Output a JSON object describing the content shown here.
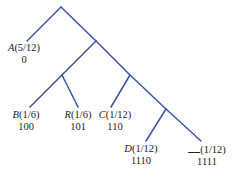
{
  "diagram": {
    "type": "huffman-code-tree",
    "line_color": "#3a55a8",
    "leaves": [
      {
        "symbol": "A",
        "prob": "(5/12)",
        "code": "0"
      },
      {
        "symbol": "B",
        "prob": "(1/6)",
        "code": "100"
      },
      {
        "symbol": "R",
        "prob": "(1/6)",
        "code": "101"
      },
      {
        "symbol": "C",
        "prob": "(1/12)",
        "code": "110"
      },
      {
        "symbol": "D",
        "prob": "(1/12)",
        "code": "1110"
      },
      {
        "symbol": "",
        "prob": "(1/12)",
        "code": "1111"
      }
    ]
  }
}
